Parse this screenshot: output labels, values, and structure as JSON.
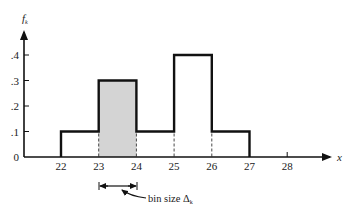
{
  "chart_data": {
    "type": "bar",
    "subtype": "histogram",
    "title": "",
    "xlabel": "x",
    "ylabel": "f_k",
    "ylabel_main": "f",
    "ylabel_sub": "k",
    "bins": [
      {
        "start": 22,
        "end": 23,
        "value": 0.1,
        "shaded": false
      },
      {
        "start": 23,
        "end": 24,
        "value": 0.3,
        "shaded": true
      },
      {
        "start": 24,
        "end": 25,
        "value": 0.1,
        "shaded": false
      },
      {
        "start": 25,
        "end": 26,
        "value": 0.4,
        "shaded": false
      },
      {
        "start": 26,
        "end": 27,
        "value": 0.1,
        "shaded": false
      }
    ],
    "categories": [
      "22-23",
      "23-24",
      "24-25",
      "25-26",
      "26-27"
    ],
    "values": [
      0.1,
      0.3,
      0.1,
      0.4,
      0.1
    ],
    "x_ticks": [
      "22",
      "23",
      "24",
      "25",
      "26",
      "27",
      "28"
    ],
    "y_ticks": [
      "0",
      ".1",
      ".2",
      ".3",
      ".4"
    ],
    "xlim": [
      21,
      29
    ],
    "ylim": [
      0,
      0.5
    ],
    "grid": false,
    "legend": null,
    "annotations": [
      {
        "text": "bin size Δk",
        "main": "bin size Δ",
        "sub": "k",
        "points_to": "width of bin 23-24"
      }
    ],
    "colors": {
      "line": "#111111",
      "shaded_fill": "#d4d4d4",
      "dashed": "#333333"
    }
  }
}
